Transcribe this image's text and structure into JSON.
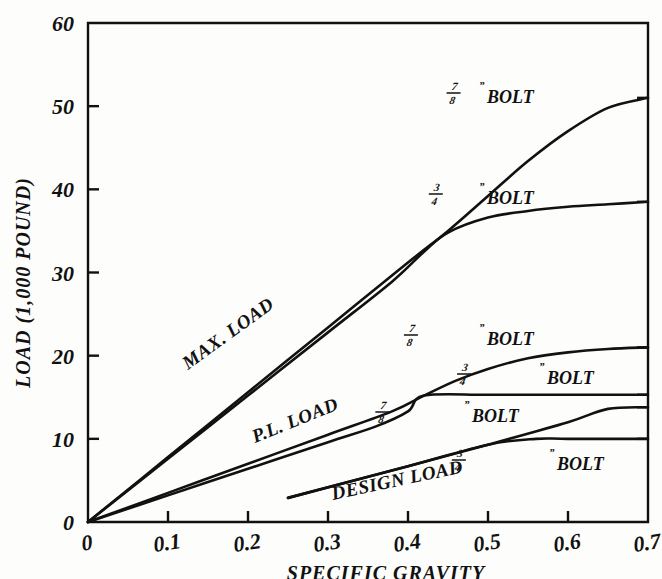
{
  "chart_data": {
    "type": "line",
    "title": "",
    "xlabel": "SPECIFIC GRAVITY",
    "ylabel": "LOAD (1,000 POUND)",
    "xlim": [
      0,
      0.7
    ],
    "ylim": [
      0,
      60
    ],
    "xticks": [
      "0",
      "0.1",
      "0.2",
      "0.3",
      "0.4",
      "0.5",
      "0.6",
      "0.7"
    ],
    "xtick_values": [
      0,
      0.1,
      0.2,
      0.3,
      0.4,
      0.5,
      0.6,
      0.7
    ],
    "yticks": [
      "0",
      "10",
      "20",
      "30",
      "40",
      "50",
      "60"
    ],
    "ytick_values": [
      0,
      10,
      20,
      30,
      40,
      50,
      60
    ],
    "grid": false,
    "legend": "inline-curve-labels",
    "group_labels": [
      "MAX. LOAD",
      "P.L. LOAD",
      "DESIGN LOAD"
    ],
    "series": [
      {
        "name": "MAX. LOAD 7/8\" BOLT",
        "group": "MAX. LOAD",
        "bolt": "7/8\"",
        "x": [
          0,
          0.1,
          0.2,
          0.3,
          0.4,
          0.45,
          0.5,
          0.55,
          0.6,
          0.65,
          0.7
        ],
        "values": [
          0,
          7.8,
          15.6,
          23.4,
          31.2,
          35.0,
          39.2,
          43.4,
          47.0,
          49.8,
          51.0
        ]
      },
      {
        "name": "MAX. LOAD 3/4\" BOLT",
        "group": "MAX. LOAD",
        "bolt": "3/4\"",
        "x": [
          0,
          0.1,
          0.2,
          0.3,
          0.38,
          0.42,
          0.45,
          0.5,
          0.55,
          0.6,
          0.65,
          0.7
        ],
        "values": [
          0,
          7.6,
          15.2,
          22.8,
          28.9,
          32.5,
          34.8,
          36.6,
          37.4,
          37.9,
          38.2,
          38.5
        ]
      },
      {
        "name": "P.L. LOAD 7/8\" BOLT",
        "group": "P.L. LOAD",
        "bolt": "7/8\"",
        "x": [
          0,
          0.1,
          0.2,
          0.3,
          0.38,
          0.42,
          0.46,
          0.5,
          0.55,
          0.6,
          0.65,
          0.7
        ],
        "values": [
          0,
          3.5,
          7.0,
          10.5,
          13.3,
          15.2,
          17.0,
          18.4,
          19.7,
          20.4,
          20.8,
          21.0
        ]
      },
      {
        "name": "P.L. LOAD 3/4\" BOLT",
        "group": "P.L. LOAD",
        "bolt": "3/4\"",
        "x": [
          0,
          0.1,
          0.2,
          0.3,
          0.36,
          0.4,
          0.42,
          0.5,
          0.6,
          0.7
        ],
        "values": [
          0,
          3.2,
          6.4,
          9.6,
          11.5,
          13.3,
          15.2,
          15.3,
          15.3,
          15.3
        ]
      },
      {
        "name": "DESIGN LOAD 7/8\" BOLT",
        "group": "DESIGN LOAD",
        "bolt": "7/8\"",
        "x": [
          0.25,
          0.4,
          0.5,
          0.6,
          0.65,
          0.7
        ],
        "values": [
          2.9,
          6.7,
          9.3,
          12.0,
          13.6,
          13.8
        ]
      },
      {
        "name": "DESIGN LOAD 3/4\" BOLT",
        "group": "DESIGN LOAD",
        "bolt": "3/4\"",
        "x": [
          0.25,
          0.4,
          0.5,
          0.56,
          0.6,
          0.7
        ],
        "values": [
          2.9,
          6.7,
          9.3,
          10.0,
          10.0,
          10.0
        ]
      }
    ],
    "annotations": [
      {
        "id": "max-78",
        "text": "BOLT",
        "fraction_num": "7",
        "fraction_den": "8",
        "inch": "”",
        "x_px": 470,
        "y_px": 96
      },
      {
        "id": "max-34",
        "text": "BOLT",
        "fraction_num": "3",
        "fraction_den": "4",
        "inch": "”",
        "x_px": 470,
        "y_px": 197
      },
      {
        "id": "pl-78",
        "text": "BOLT",
        "fraction_num": "7",
        "fraction_den": "8",
        "inch": "”",
        "x_px": 470,
        "y_px": 338
      },
      {
        "id": "pl-34",
        "text": "BOLT",
        "fraction_num": "3",
        "fraction_den": "4",
        "inch": "”",
        "x_px": 530,
        "y_px": 377
      },
      {
        "id": "design-78",
        "text": "BOLT",
        "fraction_num": "7",
        "fraction_den": "8",
        "inch": "”",
        "x_px": 455,
        "y_px": 415
      },
      {
        "id": "design-34",
        "text": "BOLT",
        "fraction_num": "3",
        "fraction_den": "4",
        "inch": "”",
        "x_px": 540,
        "y_px": 463
      },
      {
        "id": "max-load",
        "text": "MAX. LOAD",
        "x_px": 188,
        "y_px": 370,
        "rotate": -36
      },
      {
        "id": "pl-load",
        "text": "P.L. LOAD",
        "x_px": 255,
        "y_px": 443,
        "rotate": -22
      },
      {
        "id": "design-load",
        "text": "DESIGN LOAD",
        "x_px": 333,
        "y_px": 500,
        "rotate": -12
      }
    ]
  }
}
